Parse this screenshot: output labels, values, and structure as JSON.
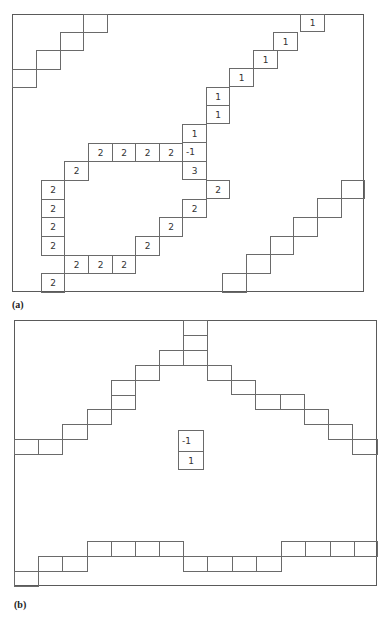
{
  "panels": {
    "a": {
      "label": "(a)",
      "frame": {
        "x": 12,
        "y": 14,
        "w": 352,
        "h": 278
      },
      "cells": [
        {
          "x": 83,
          "y": 14,
          "w": 24,
          "h": 18,
          "v": ""
        },
        {
          "x": 60,
          "y": 32,
          "w": 23,
          "h": 18,
          "v": ""
        },
        {
          "x": 36,
          "y": 50,
          "w": 24,
          "h": 19,
          "v": ""
        },
        {
          "x": 12,
          "y": 69,
          "w": 24,
          "h": 18,
          "v": ""
        },
        {
          "x": 300,
          "y": 14,
          "w": 24,
          "h": 17,
          "v": "1"
        },
        {
          "x": 273,
          "y": 32,
          "w": 24,
          "h": 18,
          "v": "1"
        },
        {
          "x": 253,
          "y": 50,
          "w": 24,
          "h": 18,
          "v": "1"
        },
        {
          "x": 229,
          "y": 68,
          "w": 24,
          "h": 18,
          "v": "1"
        },
        {
          "x": 206,
          "y": 87,
          "w": 23,
          "h": 18,
          "v": "1"
        },
        {
          "x": 206,
          "y": 105,
          "w": 23,
          "h": 18,
          "v": "1"
        },
        {
          "x": 182,
          "y": 124,
          "w": 24,
          "h": 18,
          "v": "1"
        },
        {
          "x": 182,
          "y": 142,
          "w": 24,
          "h": 19,
          "v": "-1",
          "left": true
        },
        {
          "x": 182,
          "y": 161,
          "w": 24,
          "h": 18,
          "v": "3"
        },
        {
          "x": 88,
          "y": 143,
          "w": 24,
          "h": 18,
          "v": "2"
        },
        {
          "x": 112,
          "y": 143,
          "w": 23,
          "h": 18,
          "v": "2"
        },
        {
          "x": 135,
          "y": 143,
          "w": 24,
          "h": 18,
          "v": "2"
        },
        {
          "x": 159,
          "y": 143,
          "w": 23,
          "h": 18,
          "v": "2"
        },
        {
          "x": 64,
          "y": 161,
          "w": 24,
          "h": 19,
          "v": "2"
        },
        {
          "x": 41,
          "y": 180,
          "w": 23,
          "h": 19,
          "v": "2"
        },
        {
          "x": 41,
          "y": 199,
          "w": 23,
          "h": 18,
          "v": "2"
        },
        {
          "x": 41,
          "y": 217,
          "w": 23,
          "h": 19,
          "v": "2"
        },
        {
          "x": 41,
          "y": 236,
          "w": 23,
          "h": 19,
          "v": "2"
        },
        {
          "x": 64,
          "y": 255,
          "w": 24,
          "h": 18,
          "v": "2"
        },
        {
          "x": 88,
          "y": 255,
          "w": 24,
          "h": 18,
          "v": "2"
        },
        {
          "x": 112,
          "y": 255,
          "w": 23,
          "h": 18,
          "v": "2"
        },
        {
          "x": 41,
          "y": 273,
          "w": 23,
          "h": 19,
          "v": "2"
        },
        {
          "x": 135,
          "y": 236,
          "w": 24,
          "h": 19,
          "v": "2"
        },
        {
          "x": 159,
          "y": 217,
          "w": 23,
          "h": 19,
          "v": "2"
        },
        {
          "x": 182,
          "y": 199,
          "w": 24,
          "h": 18,
          "v": "2"
        },
        {
          "x": 206,
          "y": 180,
          "w": 23,
          "h": 18,
          "v": "2"
        },
        {
          "x": 341,
          "y": 180,
          "w": 23,
          "h": 18,
          "v": ""
        },
        {
          "x": 317,
          "y": 198,
          "w": 24,
          "h": 19,
          "v": ""
        },
        {
          "x": 293,
          "y": 217,
          "w": 24,
          "h": 19,
          "v": ""
        },
        {
          "x": 270,
          "y": 236,
          "w": 23,
          "h": 18,
          "v": ""
        },
        {
          "x": 246,
          "y": 254,
          "w": 24,
          "h": 19,
          "v": ""
        },
        {
          "x": 222,
          "y": 273,
          "w": 24,
          "h": 19,
          "v": ""
        }
      ]
    },
    "b": {
      "label": "(b)",
      "frame": {
        "x": 14,
        "y": 320,
        "w": 363,
        "h": 266
      },
      "cells": [
        {
          "x": 183,
          "y": 320,
          "w": 24,
          "h": 15,
          "v": ""
        },
        {
          "x": 183,
          "y": 335,
          "w": 24,
          "h": 15,
          "v": ""
        },
        {
          "x": 183,
          "y": 350,
          "w": 24,
          "h": 15,
          "v": ""
        },
        {
          "x": 159,
          "y": 350,
          "w": 24,
          "h": 15,
          "v": ""
        },
        {
          "x": 135,
          "y": 365,
          "w": 24,
          "h": 15,
          "v": ""
        },
        {
          "x": 111,
          "y": 380,
          "w": 24,
          "h": 15,
          "v": ""
        },
        {
          "x": 111,
          "y": 395,
          "w": 24,
          "h": 14,
          "v": ""
        },
        {
          "x": 87,
          "y": 409,
          "w": 24,
          "h": 15,
          "v": ""
        },
        {
          "x": 62,
          "y": 424,
          "w": 25,
          "h": 15,
          "v": ""
        },
        {
          "x": 38,
          "y": 439,
          "w": 24,
          "h": 15,
          "v": ""
        },
        {
          "x": 14,
          "y": 439,
          "w": 24,
          "h": 15,
          "v": ""
        },
        {
          "x": 207,
          "y": 365,
          "w": 24,
          "h": 15,
          "v": ""
        },
        {
          "x": 231,
          "y": 380,
          "w": 24,
          "h": 14,
          "v": ""
        },
        {
          "x": 255,
          "y": 394,
          "w": 25,
          "h": 15,
          "v": ""
        },
        {
          "x": 280,
          "y": 394,
          "w": 24,
          "h": 15,
          "v": ""
        },
        {
          "x": 304,
          "y": 409,
          "w": 24,
          "h": 15,
          "v": ""
        },
        {
          "x": 328,
          "y": 424,
          "w": 24,
          "h": 15,
          "v": ""
        },
        {
          "x": 352,
          "y": 439,
          "w": 25,
          "h": 15,
          "v": ""
        },
        {
          "x": 178,
          "y": 430,
          "w": 25,
          "h": 21,
          "v": "-1",
          "left": true
        },
        {
          "x": 178,
          "y": 451,
          "w": 25,
          "h": 18,
          "v": "1"
        },
        {
          "x": 14,
          "y": 571,
          "w": 24,
          "h": 15,
          "v": ""
        },
        {
          "x": 38,
          "y": 556,
          "w": 24,
          "h": 15,
          "v": ""
        },
        {
          "x": 62,
          "y": 556,
          "w": 25,
          "h": 15,
          "v": ""
        },
        {
          "x": 87,
          "y": 541,
          "w": 24,
          "h": 15,
          "v": ""
        },
        {
          "x": 111,
          "y": 541,
          "w": 24,
          "h": 15,
          "v": ""
        },
        {
          "x": 135,
          "y": 541,
          "w": 24,
          "h": 15,
          "v": ""
        },
        {
          "x": 159,
          "y": 541,
          "w": 24,
          "h": 15,
          "v": ""
        },
        {
          "x": 183,
          "y": 556,
          "w": 24,
          "h": 15,
          "v": ""
        },
        {
          "x": 207,
          "y": 556,
          "w": 25,
          "h": 15,
          "v": ""
        },
        {
          "x": 232,
          "y": 556,
          "w": 24,
          "h": 15,
          "v": ""
        },
        {
          "x": 256,
          "y": 556,
          "w": 25,
          "h": 15,
          "v": ""
        },
        {
          "x": 281,
          "y": 541,
          "w": 24,
          "h": 15,
          "v": ""
        },
        {
          "x": 305,
          "y": 541,
          "w": 25,
          "h": 15,
          "v": ""
        },
        {
          "x": 330,
          "y": 541,
          "w": 24,
          "h": 15,
          "v": ""
        },
        {
          "x": 354,
          "y": 541,
          "w": 23,
          "h": 15,
          "v": ""
        }
      ]
    }
  },
  "labels": {
    "a": {
      "text": "(a)",
      "x": 12,
      "y": 299
    },
    "b": {
      "text": "(b)",
      "x": 14,
      "y": 599
    }
  }
}
